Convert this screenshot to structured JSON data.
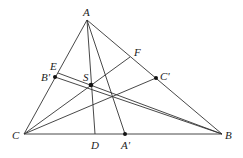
{
  "diagram": {
    "type": "triangle-geometry",
    "points": {
      "A": {
        "label": "A",
        "x": 87,
        "y": 20
      },
      "B": {
        "label": "B",
        "x": 222,
        "y": 134
      },
      "C": {
        "label": "C",
        "x": 24,
        "y": 134
      },
      "D": {
        "label": "D",
        "x": 95,
        "y": 134
      },
      "A_prime": {
        "label": "A'",
        "x": 125,
        "y": 134
      },
      "E": {
        "label": "E",
        "x": 58,
        "y": 73
      },
      "B_prime": {
        "label": "B'",
        "x": 55,
        "y": 77
      },
      "F": {
        "label": "F",
        "x": 130,
        "y": 57
      },
      "C_prime": {
        "label": "C'",
        "x": 156,
        "y": 78
      },
      "S": {
        "label": "S",
        "x": 91,
        "y": 85
      }
    },
    "labels": [
      "A",
      "B",
      "C",
      "D",
      "A'",
      "E",
      "B'",
      "F",
      "C'",
      "S"
    ]
  }
}
